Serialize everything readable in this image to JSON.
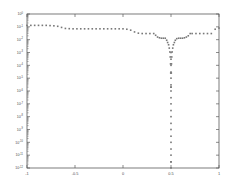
{
  "chart_data": {
    "type": "scatter",
    "title": "",
    "subtitle": "",
    "xlabel": "",
    "ylabel": "",
    "xlim": [
      -1,
      1
    ],
    "ylim": [
      1e-12,
      1
    ],
    "yscale": "log",
    "xscale": "linear",
    "grid": false,
    "legend": null,
    "legend_position": "none",
    "marker": "dot",
    "marker_color": "#777777",
    "xticks": [
      -1,
      -0.5,
      0,
      0.5,
      1
    ],
    "xticklabels": [
      "-1",
      "-0.5",
      "0",
      "0.5",
      "1"
    ],
    "yticks": [
      1,
      0.1,
      0.01,
      0.001,
      0.0001,
      1e-05,
      1e-06,
      1e-07,
      1e-08,
      1e-09,
      1e-10,
      1e-11,
      1e-12
    ],
    "yticklabels": [
      "10^0",
      "10^-1",
      "10^-2",
      "10^-3",
      "10^-4",
      "10^-5",
      "10^-6",
      "10^-7",
      "10^-8",
      "10^-9",
      "10^-10",
      "10^-11",
      "10^-12"
    ],
    "ytick_mantissa": "10",
    "ytick_exponents": [
      "0",
      "-1",
      "-2",
      "-3",
      "-4",
      "-5",
      "-6",
      "-7",
      "-8",
      "-9",
      "-10",
      "-11",
      "-12"
    ],
    "series": [
      {
        "name": "error",
        "color": "#777777",
        "x": [
          -1.0,
          -0.96,
          -0.92,
          -0.88,
          -0.84,
          -0.8,
          -0.76,
          -0.72,
          -0.68,
          -0.64,
          -0.6,
          -0.56,
          -0.52,
          -0.48,
          -0.44,
          -0.4,
          -0.36,
          -0.32,
          -0.28,
          -0.24,
          -0.2,
          -0.16,
          -0.12,
          -0.08,
          -0.04,
          0.0,
          0.04,
          0.08,
          0.12,
          0.16,
          0.2,
          0.24,
          0.28,
          0.32,
          0.34,
          0.36,
          0.38,
          0.4,
          0.42,
          0.44,
          0.455,
          0.465,
          0.475,
          0.482,
          0.488,
          0.492,
          0.495,
          0.497,
          0.499,
          0.5,
          0.501,
          0.503,
          0.505,
          0.508,
          0.512,
          0.518,
          0.525,
          0.535,
          0.545,
          0.56,
          0.58,
          0.6,
          0.62,
          0.64,
          0.66,
          0.68,
          0.7,
          0.72,
          0.76,
          0.8,
          0.84,
          0.88,
          0.92,
          0.96,
          1.0
        ],
        "y": [
          0.13,
          0.13,
          0.13,
          0.13,
          0.13,
          0.13,
          0.125,
          0.12,
          0.11,
          0.09,
          0.075,
          0.072,
          0.07,
          0.07,
          0.07,
          0.07,
          0.07,
          0.07,
          0.07,
          0.07,
          0.07,
          0.07,
          0.07,
          0.07,
          0.07,
          0.07,
          0.065,
          0.055,
          0.04,
          0.032,
          0.03,
          0.03,
          0.03,
          0.03,
          0.022,
          0.016,
          0.014,
          0.013,
          0.013,
          0.013,
          0.009,
          0.006,
          0.004,
          0.0022,
          0.0011,
          0.00045,
          0.00013,
          2.5e-05,
          2e-06,
          3e-12,
          2e-06,
          2.5e-05,
          0.00013,
          0.00045,
          0.0011,
          0.0022,
          0.004,
          0.006,
          0.009,
          0.012,
          0.013,
          0.013,
          0.013,
          0.014,
          0.016,
          0.02,
          0.03,
          0.03,
          0.03,
          0.03,
          0.03,
          0.03,
          0.03,
          0.065,
          0.08
        ],
        "spike_x": 0.5,
        "spike_y_values": [
          0.001,
          0.0003,
          0.0001,
          3e-05,
          1e-05,
          3e-06,
          1e-06,
          3e-07,
          1e-07,
          3e-08,
          1e-08,
          3e-09,
          1e-09,
          3e-10,
          1e-10,
          3e-11,
          1e-11,
          3e-12,
          1e-12
        ]
      }
    ]
  },
  "figure": {
    "background_color": "#ffffff",
    "axes_color": "#5a5a5a",
    "marker_color": "#777777"
  }
}
